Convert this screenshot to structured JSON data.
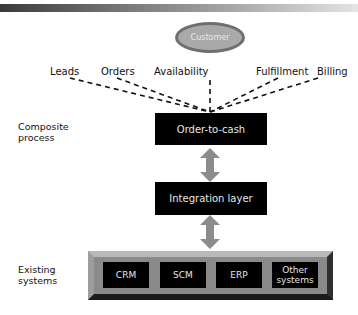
{
  "customer": "Customer",
  "channels": [
    "Leads",
    "Orders",
    "Availability",
    "Fulfillment",
    "Billing"
  ],
  "layers": {
    "composite": {
      "label_line1": "Composite",
      "label_line2": "process",
      "box": "Order-to-cash"
    },
    "integration": {
      "box": "Integration layer"
    },
    "existing": {
      "label_line1": "Existing",
      "label_line2": "systems",
      "systems": [
        {
          "line1": "CRM",
          "line2": ""
        },
        {
          "line1": "SCM",
          "line2": ""
        },
        {
          "line1": "ERP",
          "line2": ""
        },
        {
          "line1": "Other",
          "line2": "systems"
        }
      ]
    }
  }
}
